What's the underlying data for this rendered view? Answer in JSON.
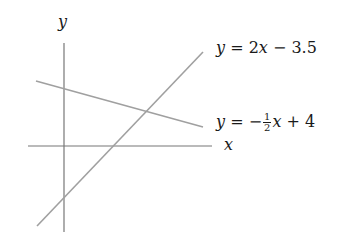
{
  "diagram": {
    "type": "coordinate-plot",
    "axes": {
      "x_label": "x",
      "y_label": "y",
      "color": "#777777"
    },
    "lines": [
      {
        "name": "line-1",
        "equation": "y = 2x − 3.5",
        "slope": 2,
        "intercept": -3.5,
        "color": "#a0a0a0",
        "label_parts": {
          "lhs": "y",
          "eq": " = 2",
          "var": "x",
          "rest": " − 3.5"
        }
      },
      {
        "name": "line-2",
        "equation": "y = −½x + 4",
        "slope": -0.5,
        "intercept": 4,
        "color": "#a0a0a0",
        "label_parts": {
          "lhs": "y",
          "eq": " = −",
          "num": "1",
          "den": "2",
          "var": "x",
          "rest": " + 4"
        }
      }
    ]
  }
}
